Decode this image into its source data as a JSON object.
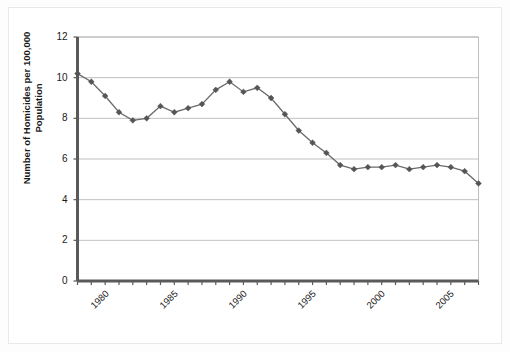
{
  "chart_data": {
    "type": "line",
    "title": "",
    "xlabel": "",
    "ylabel": "Number of Homicides per 100,000 Population",
    "ylim": [
      0,
      12
    ],
    "xlim": [
      1980,
      2009
    ],
    "yticks": [
      0,
      2,
      4,
      6,
      8,
      10,
      12
    ],
    "ytick_labels": [
      "0",
      "2",
      "4",
      "6",
      "8",
      "10",
      "12"
    ],
    "xticks": [
      1980,
      1985,
      1990,
      1995,
      2000,
      2005
    ],
    "xtick_labels": [
      "1980",
      "1985",
      "1990",
      "1995",
      "2000",
      "2005"
    ],
    "grid": "horizontal",
    "legend": "none",
    "marker": "diamond",
    "line_color": "#6b6b6b",
    "marker_color": "#555555",
    "grid_color": "#b0b0b0",
    "axis_color": "#666666",
    "x": [
      1980,
      1981,
      1982,
      1983,
      1984,
      1985,
      1986,
      1987,
      1988,
      1989,
      1990,
      1991,
      1992,
      1993,
      1994,
      1995,
      1996,
      1997,
      1998,
      1999,
      2000,
      2001,
      2002,
      2003,
      2004,
      2005,
      2006,
      2007,
      2008,
      2009
    ],
    "values": [
      10.2,
      9.8,
      9.1,
      8.3,
      7.9,
      8.0,
      8.6,
      8.3,
      8.5,
      8.7,
      9.4,
      9.8,
      9.3,
      9.5,
      9.0,
      8.2,
      7.4,
      6.8,
      6.3,
      5.7,
      5.5,
      5.6,
      5.6,
      5.7,
      5.5,
      5.6,
      5.7,
      5.6,
      5.4,
      4.8
    ]
  },
  "figure": {
    "background": "#ffffff",
    "border_color": "#e9e9e9"
  }
}
